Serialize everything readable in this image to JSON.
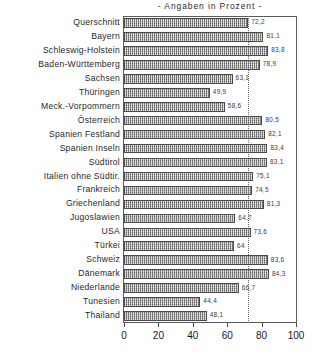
{
  "chart_data": {
    "type": "bar",
    "orientation": "horizontal",
    "title": "- Angaben in Prozent -",
    "xlabel": "",
    "ylabel": "",
    "xlim": [
      0,
      100
    ],
    "xticks": [
      0,
      20,
      40,
      60,
      80,
      100
    ],
    "grid": false,
    "legend": null,
    "reference_line": {
      "value": 72.2,
      "style": "dotted",
      "label": ""
    },
    "categories": [
      "Querschnitt",
      "Bayern",
      "Schleswig-Holstein",
      "Baden-Württemberg",
      "Sachsen",
      "Thüringen",
      "Meck.-Vorpommern",
      "Österreich",
      "Spanien Festland",
      "Spanien Inseln",
      "Südtirol",
      "Italien ohne Südtir.",
      "Frankreich",
      "Griechenland",
      "Jugoslawien",
      "USA",
      "Türkei",
      "Schweiz",
      "Dänemark",
      "Niederlande",
      "Tunesien",
      "Thailand"
    ],
    "values": [
      72.2,
      81.1,
      83.8,
      78.9,
      63.1,
      49.9,
      58.6,
      80.5,
      82.1,
      83.4,
      83.1,
      75.1,
      74.5,
      81.3,
      64.7,
      73.6,
      64.0,
      83.6,
      84.3,
      66.7,
      44.4,
      48.1
    ],
    "value_labels": [
      "72,2",
      "81,1",
      "83,8",
      "78,9",
      "63,1",
      "49,9",
      "58,6",
      "80,5",
      "82,1",
      "83,4",
      "83,1",
      "75,1",
      "74,5",
      "81,3",
      "64,7",
      "73,6",
      "64",
      "83,6",
      "84,3",
      "66,7",
      "44,4",
      "48,1"
    ],
    "tick_labels": [
      "0",
      "20",
      "40",
      "60",
      "80",
      "100"
    ],
    "colors": {
      "bar_fill": "#adadad",
      "bar_border": "#4a4a4a",
      "frame": "#5a5a5a",
      "text": "#1a1a1a",
      "background": "#ffffff"
    }
  }
}
